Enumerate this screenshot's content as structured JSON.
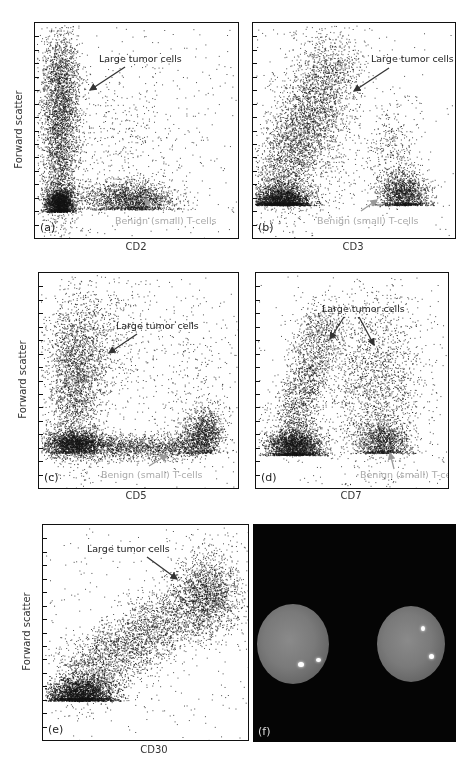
{
  "figure": {
    "panels": [
      {
        "id": "a",
        "label": "(a)",
        "xlabel": "CD2",
        "ylabel": "Forward scatter",
        "annotations": {
          "tumor": "Large tumor cells",
          "benign": "Benign (small) T-cells"
        }
      },
      {
        "id": "b",
        "label": "(b)",
        "xlabel": "CD3",
        "ylabel": "",
        "annotations": {
          "tumor": "Large tumor cells",
          "benign": "Benign (small) T-cells"
        }
      },
      {
        "id": "c",
        "label": "(c)",
        "xlabel": "CD5",
        "ylabel": "Forward scatter",
        "annotations": {
          "tumor": "Large tumor cells",
          "benign": "Benign (small) T-cells"
        }
      },
      {
        "id": "d",
        "label": "(d)",
        "xlabel": "CD7",
        "ylabel": "",
        "annotations": {
          "tumor": "Large tumor cells",
          "benign": "Benign (small) T-cells"
        }
      },
      {
        "id": "e",
        "label": "(e)",
        "xlabel": "CD30",
        "ylabel": "Forward scatter",
        "annotations": {
          "tumor": "Large tumor cells"
        }
      },
      {
        "id": "f",
        "label": "(f)",
        "type": "fluorescence-image",
        "description": "Two nuclei with bright signals on black background"
      }
    ],
    "colors": {
      "dots": "#1a1a1a",
      "annotation_dark": "#222222",
      "annotation_gray": "#aaaaaa",
      "photo_bg": "#050505"
    }
  },
  "chart_data": [
    {
      "type": "scatter",
      "panel": "a",
      "xlabel": "CD2",
      "ylabel": "Forward scatter",
      "title": "",
      "clusters": [
        {
          "name": "Large tumor cells",
          "x_range": [
            0.05,
            0.22
          ],
          "y_range": [
            0.15,
            0.95
          ],
          "note": "CD2-negative, tall column"
        },
        {
          "name": "Benign (small) T-cells",
          "x_center": 0.47,
          "y_center": 0.18,
          "note": "CD2-positive, low FSC"
        },
        {
          "name": "CD2-neg small cells",
          "x_center": 0.12,
          "y_center": 0.14
        }
      ]
    },
    {
      "type": "scatter",
      "panel": "b",
      "xlabel": "CD3",
      "ylabel": "Forward scatter",
      "title": "",
      "clusters": [
        {
          "name": "Large tumor cells",
          "x_range": [
            0.05,
            0.55
          ],
          "y_range": [
            0.2,
            0.95
          ],
          "note": "CD3-negative/dim, diagonal spread"
        },
        {
          "name": "Benign (small) T-cells",
          "x_center": 0.75,
          "y_center": 0.2
        },
        {
          "name": "CD3-neg small cells",
          "x_center": 0.15,
          "y_center": 0.15
        }
      ]
    },
    {
      "type": "scatter",
      "panel": "c",
      "xlabel": "CD5",
      "ylabel": "Forward scatter",
      "title": "",
      "clusters": [
        {
          "name": "Large tumor cells",
          "x_range": [
            0.05,
            0.3
          ],
          "y_range": [
            0.2,
            0.9
          ],
          "note": "CD5-negative"
        },
        {
          "name": "Benign (small) T-cells",
          "x_center": 0.8,
          "y_center": 0.23
        },
        {
          "name": "Horizontal band",
          "x_range": [
            0.05,
            0.85
          ],
          "y_center": 0.17
        }
      ]
    },
    {
      "type": "scatter",
      "panel": "d",
      "xlabel": "CD7",
      "ylabel": "Forward scatter",
      "title": "",
      "clusters": [
        {
          "name": "Large tumor cells (CD7-neg)",
          "x_range": [
            0.1,
            0.4
          ],
          "y_range": [
            0.25,
            0.85
          ]
        },
        {
          "name": "Large tumor cells (CD7-pos)",
          "x_range": [
            0.45,
            0.8
          ],
          "y_range": [
            0.25,
            0.85
          ]
        },
        {
          "name": "Benign (small) T-cells",
          "x_center": 0.65,
          "y_center": 0.2
        },
        {
          "name": "CD7-neg small cells",
          "x_center": 0.18,
          "y_center": 0.16
        }
      ]
    },
    {
      "type": "scatter",
      "panel": "e",
      "xlabel": "CD30",
      "ylabel": "Forward scatter",
      "title": "",
      "clusters": [
        {
          "name": "Large tumor cells",
          "x_range": [
            0.6,
            0.95
          ],
          "y_range": [
            0.45,
            0.8
          ],
          "note": "CD30-positive, diagonal trend"
        },
        {
          "name": "Small cells",
          "x_center": 0.18,
          "y_center": 0.2
        }
      ]
    }
  ]
}
